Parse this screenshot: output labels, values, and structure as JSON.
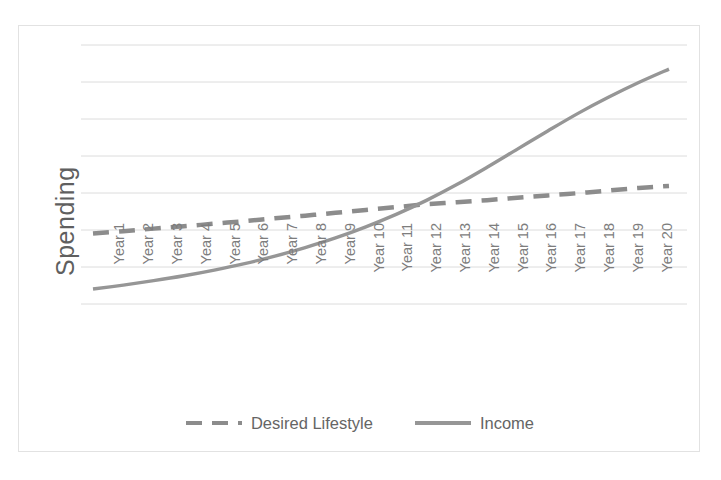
{
  "chart_data": {
    "type": "line",
    "title": "",
    "xlabel": "",
    "ylabel": "Spending",
    "grid": true,
    "gridlines": 8,
    "legend_position": "bottom",
    "axis_values_hidden": true,
    "categories": [
      "Year 1",
      "Year 2",
      "Year 3",
      "Year 4",
      "Year 5",
      "Year 6",
      "Year 7",
      "Year 8",
      "Year 9",
      "Year 10",
      "Year 11",
      "Year 12",
      "Year 13",
      "Year 14",
      "Year 15",
      "Year 16",
      "Year 17",
      "Year 18",
      "Year 19",
      "Year 20"
    ],
    "ylim": [
      0,
      1
    ],
    "series": [
      {
        "name": "Desired Lifestyle",
        "style": "dashed",
        "color": "#8c8c8c",
        "values": [
          0.272,
          0.281,
          0.291,
          0.3,
          0.31,
          0.32,
          0.331,
          0.341,
          0.352,
          0.363,
          0.374,
          0.385,
          0.393,
          0.401,
          0.41,
          0.419,
          0.428,
          0.438,
          0.448,
          0.456
        ]
      },
      {
        "name": "Income",
        "style": "solid",
        "color": "#969696",
        "values": [
          0.058,
          0.073,
          0.09,
          0.109,
          0.131,
          0.156,
          0.185,
          0.218,
          0.255,
          0.298,
          0.346,
          0.4,
          0.461,
          0.528,
          0.598,
          0.668,
          0.736,
          0.798,
          0.855,
          0.907
        ]
      }
    ]
  },
  "legend": {
    "items": [
      {
        "label": "Desired Lifestyle",
        "swatch": "dashed-line-swatch"
      },
      {
        "label": "Income",
        "swatch": "solid-line-swatch"
      }
    ]
  },
  "axis": {
    "y_title": "Spending"
  },
  "colors": {
    "frame_border": "#e2e2e2",
    "gridline": "#dcdcdc",
    "tick_label": "#7d7d7d",
    "axis_title": "#5f5f5f",
    "desired_lifestyle": "#8c8c8c",
    "income": "#969696",
    "background": "#ffffff"
  }
}
